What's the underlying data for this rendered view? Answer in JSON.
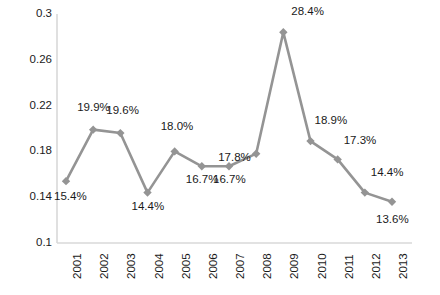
{
  "chart_data": {
    "type": "line",
    "title": "",
    "subtitle": "",
    "xlabel": "",
    "ylabel": "",
    "categories": [
      "2001",
      "2002",
      "2003",
      "2004",
      "2005",
      "2006",
      "2007",
      "2008",
      "2009",
      "2010",
      "2011",
      "2012",
      "2013"
    ],
    "values": [
      0.154,
      0.199,
      0.196,
      0.144,
      0.18,
      0.167,
      0.167,
      0.178,
      0.284,
      0.189,
      0.173,
      0.144,
      0.136
    ],
    "point_labels": [
      "15.4%",
      "19.9%",
      "19.6%",
      "14.4%",
      "18.0%",
      "16.7%",
      "16.7%",
      "17.8%",
      "28.4%",
      "18.9%",
      "17.3%",
      "14.4%",
      "13.6%"
    ],
    "ylim": [
      0.1,
      0.3
    ],
    "y_ticks": [
      "0.1",
      "0.14",
      "0.18",
      "0.22",
      "0.26",
      "0.3"
    ],
    "y_tick_values": [
      0.1,
      0.14,
      0.18,
      0.22,
      0.26,
      0.3
    ],
    "grid": false,
    "legend": false,
    "legend_position": "none",
    "series": [
      {
        "name": "",
        "values": [
          0.154,
          0.199,
          0.196,
          0.144,
          0.18,
          0.167,
          0.167,
          0.178,
          0.284,
          0.189,
          0.173,
          0.144,
          0.136
        ],
        "color": "#949494",
        "marker": "diamond"
      }
    ],
    "colors": {
      "line": "#949494",
      "marker": "#949494",
      "axis": "#d9d9d9",
      "text": "#1a1a1a",
      "background": "#ffffff"
    }
  },
  "label_offsets": [
    {
      "dx": -12,
      "dy": 16
    },
    {
      "dx": -16,
      "dy": -22
    },
    {
      "dx": -14,
      "dy": -22
    },
    {
      "dx": -16,
      "dy": 14
    },
    {
      "dx": -14,
      "dy": -24
    },
    {
      "dx": -16,
      "dy": 14
    },
    {
      "dx": -16,
      "dy": 14
    },
    {
      "dx": -38,
      "dy": 4
    },
    {
      "dx": 8,
      "dy": -20
    },
    {
      "dx": 4,
      "dy": -20
    },
    {
      "dx": 6,
      "dy": -18
    },
    {
      "dx": 6,
      "dy": -20
    },
    {
      "dx": -16,
      "dy": 18
    }
  ]
}
